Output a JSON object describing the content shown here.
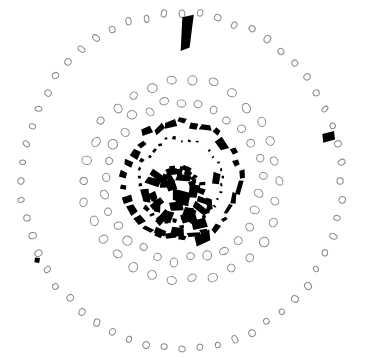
{
  "figure": {
    "name": "stonehenge-site-plan",
    "type": "archaeological-site-plan",
    "background_color": "#ffffff",
    "width": 365,
    "height": 363,
    "center": [
      182,
      181
    ],
    "hole_outline_color": "#8a8a8a",
    "hole_fill_color": "#ffffff",
    "stone_fill_color": "#000000"
  },
  "chart_data": {
    "type": "scatter",
    "title": "",
    "xlabel": "",
    "ylabel": "",
    "xlim": [
      0,
      365
    ],
    "ylim": [
      0,
      363
    ],
    "grid": false,
    "legend": "none",
    "series": [
      {
        "name": "Aubrey Holes (outer ring)",
        "style": "open-oval",
        "count": 56,
        "radius_px": 160,
        "center": [
          182,
          181
        ],
        "start_angle_deg": -90,
        "oval_w": 5.6,
        "oval_h": 6.6
      },
      {
        "name": "Y Holes",
        "style": "open-oval",
        "count": 30,
        "radius_px": 98,
        "center": [
          182,
          181
        ],
        "start_angle_deg": -84,
        "oval_w": 8.2,
        "oval_h": 8.2
      },
      {
        "name": "Z Holes",
        "style": "open-oval",
        "count": 29,
        "radius_px": 78,
        "center": [
          182,
          181
        ],
        "start_angle_deg": -78,
        "oval_w": 8.0,
        "oval_h": 8.0
      },
      {
        "name": "Sarsen Circle",
        "style": "filled-block",
        "count": 30,
        "radius_px": 57,
        "center": [
          182,
          181
        ],
        "start_angle_deg": -90,
        "present_indices": [
          0,
          1,
          2,
          3,
          4,
          5,
          6,
          7,
          8,
          9,
          10,
          11,
          12,
          13,
          14,
          15,
          16,
          17,
          18,
          19,
          20,
          21,
          22,
          23,
          24,
          25,
          26,
          27,
          28,
          29
        ]
      },
      {
        "name": "Bluestone Circle",
        "style": "filled-small",
        "count": 34,
        "radius_px": 42,
        "center": [
          182,
          181
        ],
        "start_angle_deg": -90
      },
      {
        "name": "Trilithon Horseshoe",
        "style": "filled-large-block",
        "count": 10,
        "radius_px": 26,
        "center": [
          181,
          190
        ]
      },
      {
        "name": "Bluestone Horseshoe",
        "style": "filled-block",
        "count": 19,
        "radius_px": 18,
        "center": [
          181,
          191
        ]
      },
      {
        "name": "Altar Stone",
        "style": "filled-block",
        "count": 1,
        "position": [
          181,
          202
        ]
      },
      {
        "name": "Heel Stone / north entrance stone",
        "style": "filled-large",
        "count": 1,
        "position": [
          187,
          33
        ]
      },
      {
        "name": "Station Stone (east)",
        "style": "filled-medium",
        "count": 1,
        "position": [
          329,
          137
        ]
      },
      {
        "name": "Station Stone (southwest)",
        "style": "filled-small",
        "count": 1,
        "position": [
          37,
          260
        ]
      }
    ]
  },
  "rings": {
    "aubrey_label": "Aubrey Holes",
    "y_holes_label": "Y Holes",
    "z_holes_label": "Z Holes",
    "sarsen_label": "Sarsen Circle",
    "bluestone_label": "Bluestone Circle",
    "trilithon_label": "Trilithon Horseshoe",
    "altar_label": "Altar Stone",
    "heel_label": "Heel Stone",
    "station_label": "Station Stone"
  }
}
